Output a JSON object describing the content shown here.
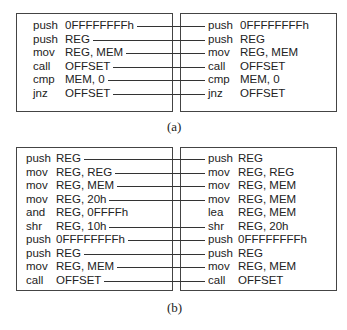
{
  "figures": [
    {
      "id": "a",
      "caption": "(a)",
      "left": [
        {
          "op": "push",
          "arg": "0FFFFFFFFh",
          "linked": true
        },
        {
          "op": "push",
          "arg": "REG",
          "linked": true
        },
        {
          "op": "mov",
          "arg": "REG, MEM",
          "linked": true
        },
        {
          "op": "call",
          "arg": "OFFSET",
          "linked": true
        },
        {
          "op": "cmp",
          "arg": "MEM, 0",
          "linked": true
        },
        {
          "op": "jnz",
          "arg": "OFFSET",
          "linked": true
        }
      ],
      "right": [
        {
          "op": "push",
          "arg": "0FFFFFFFFh",
          "linked": true
        },
        {
          "op": "push",
          "arg": "REG",
          "linked": true
        },
        {
          "op": "mov",
          "arg": "REG, MEM",
          "linked": true
        },
        {
          "op": "call",
          "arg": "OFFSET",
          "linked": true
        },
        {
          "op": "cmp",
          "arg": "MEM, 0",
          "linked": true
        },
        {
          "op": "jnz",
          "arg": "OFFSET",
          "linked": true
        }
      ]
    },
    {
      "id": "b",
      "caption": "(b)",
      "left": [
        {
          "op": "push",
          "arg": "REG",
          "linked": true
        },
        {
          "op": "mov",
          "arg": "REG, REG",
          "linked": true
        },
        {
          "op": "mov",
          "arg": "REG, MEM",
          "linked": true
        },
        {
          "op": "mov",
          "arg": "REG, 20h",
          "linked": true
        },
        {
          "op": "and",
          "arg": "REG, 0FFFFh",
          "linked": false
        },
        {
          "op": "shr",
          "arg": "REG, 10h",
          "linked": true
        },
        {
          "op": "push",
          "arg": "0FFFFFFFFh",
          "linked": true
        },
        {
          "op": "push",
          "arg": "REG",
          "linked": true
        },
        {
          "op": "mov",
          "arg": "REG, MEM",
          "linked": true
        },
        {
          "op": "call",
          "arg": "OFFSET",
          "linked": true
        }
      ],
      "right": [
        {
          "op": "push",
          "arg": "REG",
          "linked": true
        },
        {
          "op": "mov",
          "arg": "REG, REG",
          "linked": true
        },
        {
          "op": "mov",
          "arg": "REG, MEM",
          "linked": true
        },
        {
          "op": "mov",
          "arg": "REG, MEM",
          "linked": true
        },
        {
          "op": "lea",
          "arg": "REG, MEM",
          "linked": false
        },
        {
          "op": "shr",
          "arg": "REG, 20h",
          "linked": true
        },
        {
          "op": "push",
          "arg": "0FFFFFFFFh",
          "linked": true
        },
        {
          "op": "push",
          "arg": "REG",
          "linked": true
        },
        {
          "op": "mov",
          "arg": "REG, MEM",
          "linked": true
        },
        {
          "op": "call",
          "arg": "OFFSET",
          "linked": true
        }
      ]
    }
  ]
}
